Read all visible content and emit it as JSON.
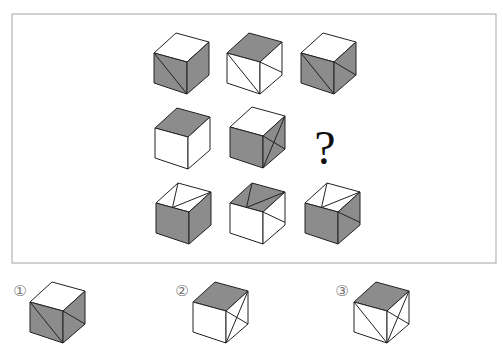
{
  "colors": {
    "gray": "#8c8c8c",
    "white": "#ffffff",
    "line": "#222222",
    "frame": "#b4b4b4"
  },
  "puzzle": {
    "frame": {
      "x": 12,
      "y": 14,
      "w": 484,
      "h": 249
    },
    "question_mark": "?",
    "cube_geometry": {
      "note_in_px": "top, left-top, front-top, right-top, left-bottom, front-bottom, right-bottom",
      "dx_left": -20,
      "dy_left": 20,
      "dx_right": 35,
      "dy_right": 9,
      "front_height": 32
    },
    "grid": [
      {
        "id": "r1c1",
        "origin": [
          187,
          62
        ],
        "top": "white",
        "left": "gray",
        "right": "gray",
        "lines": [
          [
            "lt",
            "fb"
          ]
        ]
      },
      {
        "id": "r1c2",
        "origin": [
          260,
          62
        ],
        "top": "gray",
        "left": "white",
        "right": "white",
        "lines": [
          [
            "lt",
            "fb"
          ],
          [
            "ft",
            "rb_mid"
          ]
        ]
      },
      {
        "id": "r1c3",
        "origin": [
          334,
          62
        ],
        "top": "white",
        "left": "gray",
        "right": "gray",
        "lines": [
          [
            "lt",
            "fb"
          ],
          [
            "ft",
            "rb"
          ]
        ]
      },
      {
        "id": "r2c1",
        "origin": [
          188,
          137
        ],
        "top": "gray",
        "left": "white",
        "right": "white",
        "lines": []
      },
      {
        "id": "r2c2",
        "origin": [
          263,
          136
        ],
        "top": "white",
        "left": "gray",
        "right": "gray",
        "lines": [
          [
            "ft",
            "rb"
          ],
          [
            "fb",
            "rt"
          ]
        ]
      },
      {
        "id": "r3c1",
        "origin": [
          189,
          212
        ],
        "top": "white",
        "left": "gray",
        "right": "gray",
        "lines": [
          [
            "t",
            "top_front_left_mid"
          ],
          [
            "rt",
            "top_front_left_mid"
          ]
        ]
      },
      {
        "id": "r3c2",
        "origin": [
          263,
          212
        ],
        "top": "gray",
        "left": "white",
        "right": "white",
        "lines": [
          [
            "t",
            "top_front_left_mid"
          ],
          [
            "rt",
            "top_front_left_mid"
          ],
          [
            "ft",
            "rb_mid"
          ]
        ]
      },
      {
        "id": "r3c3",
        "origin": [
          338,
          212
        ],
        "top": "white",
        "left": "gray",
        "right": "gray",
        "lines": [
          [
            "t",
            "top_front_left_mid"
          ],
          [
            "rt",
            "top_front_left_mid"
          ],
          [
            "ft",
            "rb_mid"
          ]
        ]
      }
    ]
  },
  "options": [
    {
      "label": "①",
      "label_pos": [
        20,
        291
      ],
      "cube": {
        "origin": [
          63,
          311
        ],
        "top": "white",
        "left": "gray",
        "right": "gray",
        "lines": [
          [
            "lt",
            "fb"
          ],
          [
            "ft",
            "rb"
          ]
        ]
      }
    },
    {
      "label": "②",
      "label_pos": [
        182,
        291
      ],
      "cube": {
        "origin": [
          226,
          311
        ],
        "top": "gray",
        "left": "white",
        "right": "white",
        "lines": [
          [
            "ft",
            "rb"
          ],
          [
            "fb",
            "rt"
          ]
        ]
      }
    },
    {
      "label": "③",
      "label_pos": [
        342,
        291
      ],
      "cube": {
        "origin": [
          387,
          311
        ],
        "top": "gray",
        "left": "white",
        "right": "white",
        "lines": [
          [
            "lt",
            "fb"
          ],
          [
            "ft",
            "rb"
          ],
          [
            "fb",
            "rt"
          ]
        ]
      }
    }
  ]
}
